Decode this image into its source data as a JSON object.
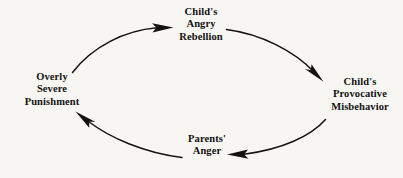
{
  "diagram": {
    "type": "cycle-diagram",
    "title": "",
    "background_color": "#f7f6f3",
    "ink_color": "#131211",
    "nodes": [
      {
        "id": "rebellion",
        "position": "top",
        "lines": [
          "Child's",
          "Angry",
          "Rebellion"
        ]
      },
      {
        "id": "misbehavior",
        "position": "right",
        "lines": [
          "Child's",
          "Provocative",
          "Misbehavior"
        ]
      },
      {
        "id": "parents_anger",
        "position": "bottom",
        "lines": [
          "Parents'",
          "Anger"
        ]
      },
      {
        "id": "punishment",
        "position": "left",
        "lines": [
          "Overly",
          "Severe",
          "Punishment"
        ]
      }
    ],
    "arrows": [
      {
        "id": "punishment-to-rebellion",
        "from": "punishment",
        "to": "rebellion",
        "direction": "clockwise",
        "arrowhead": "solid-triangle"
      },
      {
        "id": "rebellion-to-misbehavior",
        "from": "rebellion",
        "to": "misbehavior",
        "direction": "clockwise",
        "arrowhead": "solid-triangle"
      },
      {
        "id": "misbehavior-to-parents-anger",
        "from": "misbehavior",
        "to": "parents_anger",
        "direction": "clockwise",
        "arrowhead": "solid-triangle"
      },
      {
        "id": "parents-anger-to-punishment",
        "from": "parents_anger",
        "to": "punishment",
        "direction": "clockwise",
        "arrowhead": "solid-triangle"
      }
    ]
  }
}
